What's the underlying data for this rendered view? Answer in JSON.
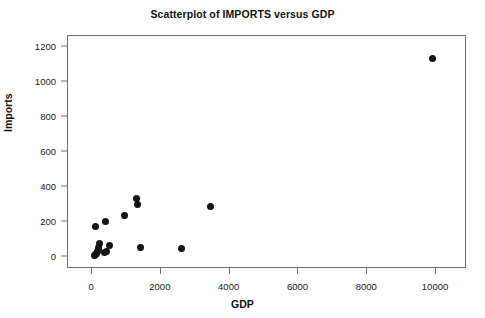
{
  "chart_data": {
    "type": "scatter",
    "title": "Scatterplot of IMPORTS versus GDP",
    "xlabel": "GDP",
    "ylabel": "Imports",
    "xlim": [
      -700,
      10900
    ],
    "ylim": [
      -70,
      1265
    ],
    "xticks": [
      0,
      2000,
      4000,
      6000,
      8000,
      10000
    ],
    "yticks": [
      0,
      200,
      400,
      600,
      800,
      1000,
      1200
    ],
    "xtick_labels": [
      "0",
      "2000",
      "4000",
      "6000",
      "8000",
      "10000"
    ],
    "ytick_labels": [
      "0",
      "200",
      "400",
      "600",
      "800",
      "1000",
      "1200"
    ],
    "grid": false,
    "legend": null,
    "marker": {
      "shape": "circle",
      "color": "#141414",
      "size": 7
    },
    "series": [
      {
        "name": "Imports vs GDP",
        "points": [
          {
            "x": 60,
            "y": 5
          },
          {
            "x": 95,
            "y": 12
          },
          {
            "x": 130,
            "y": 18
          },
          {
            "x": 150,
            "y": 30
          },
          {
            "x": 180,
            "y": 42
          },
          {
            "x": 200,
            "y": 55
          },
          {
            "x": 230,
            "y": 78
          },
          {
            "x": 110,
            "y": 175
          },
          {
            "x": 385,
            "y": 200
          },
          {
            "x": 350,
            "y": 22
          },
          {
            "x": 420,
            "y": 28
          },
          {
            "x": 520,
            "y": 62
          },
          {
            "x": 940,
            "y": 235
          },
          {
            "x": 1300,
            "y": 335
          },
          {
            "x": 1320,
            "y": 302
          },
          {
            "x": 1400,
            "y": 55
          },
          {
            "x": 2600,
            "y": 50
          },
          {
            "x": 3450,
            "y": 288
          },
          {
            "x": 9900,
            "y": 1135
          }
        ]
      }
    ]
  }
}
